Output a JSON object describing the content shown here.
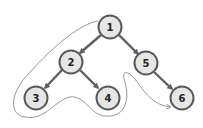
{
  "diagram": {
    "type": "tree-traversal",
    "nodes": [
      {
        "id": "1",
        "label": "1",
        "x": 110,
        "y": 27
      },
      {
        "id": "2",
        "label": "2",
        "x": 71,
        "y": 62
      },
      {
        "id": "3",
        "label": "3",
        "x": 36,
        "y": 98
      },
      {
        "id": "4",
        "label": "4",
        "x": 108,
        "y": 98
      },
      {
        "id": "5",
        "label": "5",
        "x": 146,
        "y": 63
      },
      {
        "id": "6",
        "label": "6",
        "x": 182,
        "y": 98
      }
    ],
    "edges": [
      {
        "from": "1",
        "to": "2"
      },
      {
        "from": "1",
        "to": "5"
      },
      {
        "from": "2",
        "to": "3"
      },
      {
        "from": "2",
        "to": "4"
      },
      {
        "from": "5",
        "to": "6"
      }
    ],
    "traversal_path": {
      "description": "Depth-first traversal contour around nodes 1, 2, 3, 4 ending at 6",
      "color": "#8a8a8a"
    },
    "colors": {
      "node_fill": "#e6e6e6",
      "node_stroke": "#5a5a5a",
      "edge": "#5f5f5f"
    }
  }
}
